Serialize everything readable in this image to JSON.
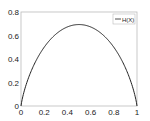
{
  "chart_data": {
    "type": "line",
    "title": "",
    "xlabel": "",
    "ylabel": "",
    "xlim": [
      0,
      1
    ],
    "ylim": [
      0,
      0.8
    ],
    "grid": false,
    "legend_position": "upper right",
    "xticks": [
      "0",
      "0.2",
      "0.4",
      "0.6",
      "0.8",
      "1"
    ],
    "yticks": [
      "0",
      "0.2",
      "0.4",
      "0.6",
      "0.8"
    ],
    "series": [
      {
        "name": "H(X)",
        "color": "#000000",
        "x": [
          0,
          0.01,
          0.05,
          0.1,
          0.2,
          0.3,
          0.4,
          0.5,
          0.6,
          0.7,
          0.8,
          0.9,
          0.95,
          0.99,
          1
        ],
        "y": [
          0,
          0.056,
          0.199,
          0.325,
          0.5,
          0.611,
          0.673,
          0.693,
          0.673,
          0.611,
          0.5,
          0.325,
          0.199,
          0.056,
          0
        ]
      }
    ]
  }
}
